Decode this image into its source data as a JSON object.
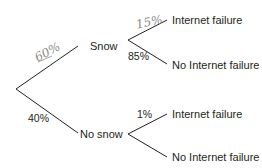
{
  "diagram": {
    "type": "probability-tree",
    "line_color": "#231f20",
    "handwriting_color": "#8a8a8a",
    "root": {
      "branches": [
        {
          "label": "Snow",
          "probability_handwritten": "60%",
          "children": [
            {
              "label": "Internet failure",
              "probability_handwritten": "15%"
            },
            {
              "label": "No Internet failure",
              "probability": "85%"
            }
          ]
        },
        {
          "label": "No snow",
          "probability": "40%",
          "children": [
            {
              "label": "Internet failure",
              "probability": "1%"
            },
            {
              "label": "No Internet failure",
              "probability": ""
            }
          ]
        }
      ]
    }
  }
}
